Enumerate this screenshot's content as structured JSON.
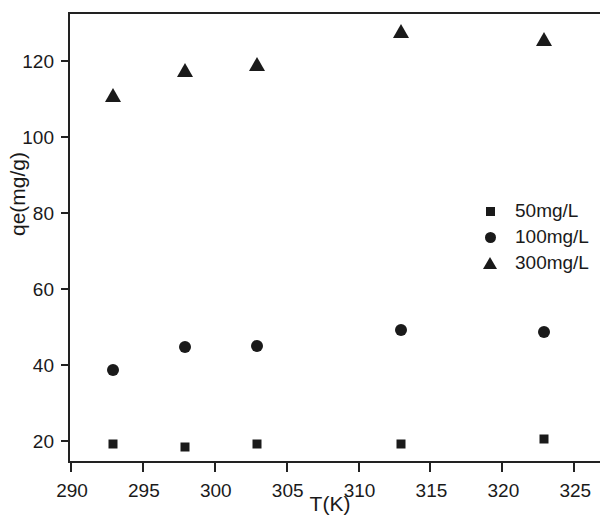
{
  "chart_data": {
    "type": "scatter",
    "title": "",
    "xlabel": "T(K)",
    "ylabel": "qe(mg/g)",
    "xlim": [
      290,
      327
    ],
    "ylim": [
      13.5,
      132
    ],
    "xticks": [
      290,
      295,
      300,
      305,
      310,
      315,
      320,
      325
    ],
    "xtick_labels": [
      "290",
      "295",
      "300",
      "305",
      "310",
      "315",
      "320",
      "325"
    ],
    "yticks": [
      20,
      40,
      60,
      80,
      100,
      120
    ],
    "ytick_labels": [
      "20",
      "40",
      "60",
      "80",
      "100",
      "120"
    ],
    "grid": false,
    "legend_position": "right-center",
    "marker_color": "#1a1a1a",
    "x": [
      293,
      298,
      303,
      313,
      323
    ],
    "series": [
      {
        "name": "50mg/L",
        "marker": "square",
        "values": [
          19.0,
          18.2,
          19.1,
          19.0,
          20.4
        ]
      },
      {
        "name": "100mg/L",
        "marker": "circle",
        "values": [
          38.5,
          44.4,
          44.7,
          49.0,
          48.5
        ]
      },
      {
        "name": "300mg/L",
        "marker": "triangle",
        "values": [
          110.8,
          117.4,
          118.9,
          127.6,
          125.4
        ]
      }
    ]
  },
  "legend": {
    "entries": [
      {
        "label": "50mg/L",
        "marker": "square"
      },
      {
        "label": "100mg/L",
        "marker": "circle"
      },
      {
        "label": "300mg/L",
        "marker": "triangle"
      }
    ]
  }
}
